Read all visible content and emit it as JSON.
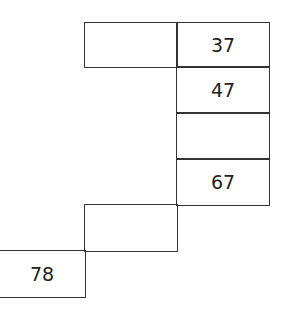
{
  "diagram": {
    "type": "staircase-number-grid",
    "cells": [
      {
        "row": 0,
        "col": 2,
        "value": ""
      },
      {
        "row": 0,
        "col": 3,
        "value": "37"
      },
      {
        "row": 1,
        "col": 3,
        "value": "47"
      },
      {
        "row": 2,
        "col": 3,
        "value": ""
      },
      {
        "row": 3,
        "col": 3,
        "value": "67"
      },
      {
        "row": 4,
        "col": 2,
        "value": ""
      },
      {
        "row": 5,
        "col": 1,
        "value": "78"
      }
    ],
    "line_color": "#333333",
    "text_color": "#222222"
  }
}
